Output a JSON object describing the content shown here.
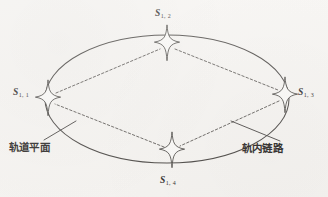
{
  "figure": {
    "kind": "orbital-plane-diagram",
    "background_color": "#f6f4f1",
    "ink_color": "#4a4744",
    "width": 328,
    "height": 197,
    "orbit": {
      "name": "orbit-ellipse",
      "center_x": 167,
      "center_y": 99,
      "radius_x": 122,
      "radius_y": 64,
      "stroke": "#4a4744",
      "style": "solid"
    },
    "satellites": [
      {
        "id": "S1-1",
        "label_main": "S",
        "label_sub": "1, 1",
        "position": "left",
        "x": 48,
        "y": 98,
        "label_x": 13,
        "label_y": 88
      },
      {
        "id": "S1-2",
        "label_main": "S",
        "label_sub": "1, 2",
        "position": "top",
        "x": 167,
        "y": 43,
        "label_x": 155,
        "label_y": 9
      },
      {
        "id": "S1-3",
        "label_main": "S",
        "label_sub": "1, 3",
        "position": "right",
        "x": 285,
        "y": 95,
        "label_x": 298,
        "label_y": 88
      },
      {
        "id": "S1-4",
        "label_main": "S",
        "label_sub": "1, 4",
        "position": "bottom",
        "x": 172,
        "y": 150,
        "label_x": 160,
        "label_y": 176
      }
    ],
    "links": [
      {
        "id": "link-s11-s12",
        "from": "S1-1",
        "to": "S1-2",
        "style": "dashed"
      },
      {
        "id": "link-s12-s13",
        "from": "S1-2",
        "to": "S1-3",
        "style": "dashed"
      },
      {
        "id": "link-s13-s14",
        "from": "S1-3",
        "to": "S1-4",
        "style": "dashed"
      },
      {
        "id": "link-s14-s11",
        "from": "S1-4",
        "to": "S1-1",
        "style": "dashed"
      }
    ],
    "annotations": [
      {
        "id": "orbital-plane",
        "text": "轨道平面",
        "text_x": 9,
        "text_y": 142,
        "leader_from_x": 44,
        "leader_from_y": 140,
        "leader_to_x": 76,
        "leader_to_y": 121
      },
      {
        "id": "intra-orbit-link",
        "text": "轨内链路",
        "text_x": 242,
        "text_y": 143,
        "leader_from_x": 280,
        "leader_from_y": 141,
        "leader_to_x": 231,
        "leader_to_y": 121
      }
    ]
  }
}
